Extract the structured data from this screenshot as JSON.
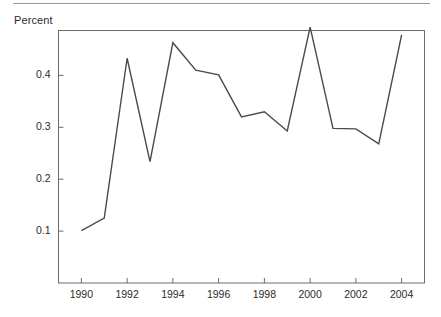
{
  "figure": {
    "y_axis_title": "Percent",
    "rule_color": "#9a9a9a",
    "frame_color": "#6b6b6b",
    "line_color": "#4a4a4a",
    "text_color": "#2b2b2b"
  },
  "chart_data": {
    "type": "line",
    "title": "",
    "subtitle": "",
    "xlabel": "",
    "ylabel": "Percent",
    "grid": false,
    "legend": null,
    "xlim": [
      1989,
      2005
    ],
    "ylim": [
      0.0,
      0.4865
    ],
    "x_tick_labels": [
      "1990",
      "1992",
      "1994",
      "1996",
      "1998",
      "2000",
      "2002",
      "2004"
    ],
    "x_tick_values": [
      1990,
      1992,
      1994,
      1996,
      1998,
      2000,
      2002,
      2004
    ],
    "x_minor_tick_values": [
      1991,
      1993,
      1995,
      1997,
      1999,
      2001,
      2003
    ],
    "y_tick_labels": [
      "0.1",
      "0.2",
      "0.3",
      "0.4"
    ],
    "y_tick_values": [
      0.1,
      0.2,
      0.3,
      0.4
    ],
    "x": [
      1990,
      1991,
      1992,
      1993,
      1994,
      1995,
      1996,
      1997,
      1998,
      1999,
      2000,
      2001,
      2002,
      2003,
      2004
    ],
    "categories": [
      "1990",
      "1991",
      "1992",
      "1993",
      "1994",
      "1995",
      "1996",
      "1997",
      "1998",
      "1999",
      "2000",
      "2001",
      "2002",
      "2003",
      "2004"
    ],
    "values": [
      0.101,
      0.125,
      0.433,
      0.234,
      0.463,
      0.41,
      0.401,
      0.32,
      0.33,
      0.293,
      0.493,
      0.298,
      0.297,
      0.268,
      0.478
    ],
    "series": [
      {
        "name": "Percent",
        "values": [
          0.101,
          0.125,
          0.433,
          0.234,
          0.463,
          0.41,
          0.401,
          0.32,
          0.33,
          0.293,
          0.493,
          0.298,
          0.297,
          0.268,
          0.478
        ]
      }
    ]
  }
}
